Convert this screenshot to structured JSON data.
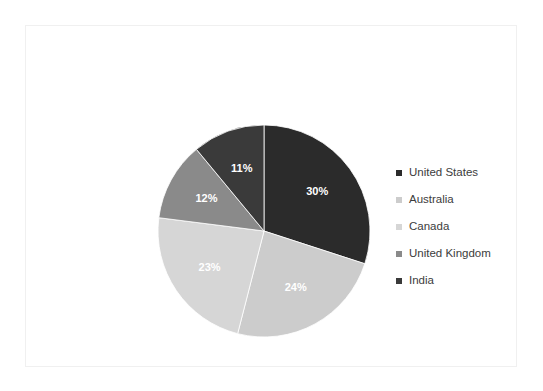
{
  "chart_data": {
    "type": "pie",
    "title": "",
    "subtitle": "",
    "xlabel": "",
    "ylabel": "",
    "grid": false,
    "legend_position": "right",
    "start_angle_oclock": 12,
    "direction": "clockwise",
    "categories": [
      "United States",
      "Australia",
      "Canada",
      "United Kingdom",
      "India"
    ],
    "values": [
      30,
      24,
      23,
      12,
      11
    ],
    "value_unit": "%",
    "data_labels": [
      "30%",
      "24%",
      "23%",
      "12%",
      "11%"
    ],
    "colors": [
      "#2b2b2b",
      "#cccccc",
      "#d6d6d6",
      "#8a8a8a",
      "#3a3a3a"
    ],
    "slices": [
      {
        "label": "United States",
        "value": 30,
        "data_label": "30%",
        "color": "#2b2b2b",
        "label_color": "#ffffff"
      },
      {
        "label": "Australia",
        "value": 24,
        "data_label": "24%",
        "color": "#cccccc",
        "label_color": "#ffffff"
      },
      {
        "label": "Canada",
        "value": 23,
        "data_label": "23%",
        "color": "#d6d6d6",
        "label_color": "#ffffff"
      },
      {
        "label": "United Kingdom",
        "value": 12,
        "data_label": "12%",
        "color": "#8a8a8a",
        "label_color": "#ffffff"
      },
      {
        "label": "India",
        "value": 11,
        "data_label": "11%",
        "color": "#3a3a3a",
        "label_color": "#ffffff"
      }
    ]
  },
  "legend": {
    "items": [
      {
        "label": "United States",
        "color": "#2b2b2b"
      },
      {
        "label": "Australia",
        "color": "#cccccc"
      },
      {
        "label": "Canada",
        "color": "#d6d6d6"
      },
      {
        "label": "United Kingdom",
        "color": "#8a8a8a"
      },
      {
        "label": "India",
        "color": "#3a3a3a"
      }
    ]
  },
  "frame": {
    "border_color": "#f0f0f0",
    "background": "#ffffff"
  }
}
